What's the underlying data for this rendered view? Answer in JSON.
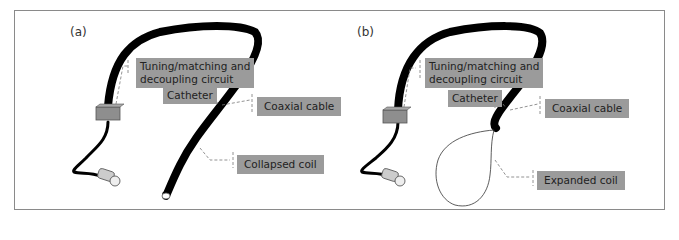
{
  "figure": {
    "panels": [
      {
        "id": "a",
        "label": "(a)",
        "callouts": {
          "circuit": "Tuning/matching and decoupling circuit",
          "circuit_line1": "Tuning/matching and",
          "circuit_line2": "decoupling circuit",
          "catheter": "Catheter",
          "coax": "Coaxial cable",
          "coil": "Collapsed coil"
        }
      },
      {
        "id": "b",
        "label": "(b)",
        "callouts": {
          "circuit": "Tuning/matching and decoupling circuit",
          "circuit_line1": "Tuning/matching and",
          "circuit_line2": "decoupling circuit",
          "catheter": "Catheter",
          "coax": "Coaxial cable",
          "coil": "Expanded coil"
        }
      }
    ],
    "colors": {
      "label_bg": "#9b9b9b",
      "cable": "#000000",
      "box": "#8e8e8e",
      "frame": "#8a8a8a"
    }
  }
}
